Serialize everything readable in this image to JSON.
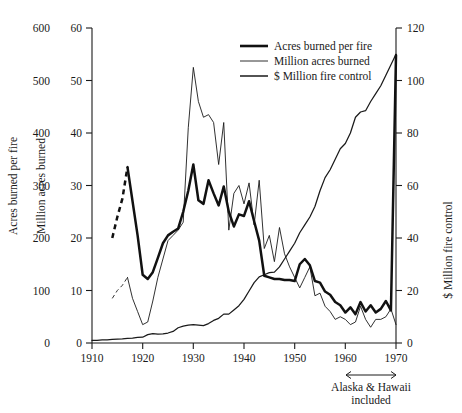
{
  "chart_data": {
    "type": "line",
    "title": "",
    "subtitle": "",
    "xlabel": "",
    "xlim": [
      1910,
      1970
    ],
    "grid": false,
    "legend_position": "top-center-right",
    "x_ticks": [
      1910,
      1920,
      1930,
      1940,
      1950,
      1960,
      1970
    ],
    "x_tick_labels": [
      "1910",
      "1920",
      "1930",
      "1940",
      "1950",
      "1960",
      "1970"
    ],
    "axes": [
      {
        "id": "outer-left",
        "side": "left",
        "label": "Acres burned per fire",
        "ylim": [
          0,
          600
        ],
        "ticks": [
          0,
          100,
          200,
          300,
          400,
          500,
          600
        ],
        "tick_labels": [
          "0",
          "100",
          "200",
          "300",
          "400",
          "500",
          "600"
        ],
        "has_spine": false
      },
      {
        "id": "inner-left",
        "side": "left",
        "label": "Million acres burned",
        "ylim": [
          0,
          60
        ],
        "ticks": [
          0,
          10,
          20,
          30,
          40,
          50,
          60
        ],
        "tick_labels": [
          "0",
          "10",
          "20",
          "30",
          "40",
          "50",
          "60"
        ],
        "has_spine": true
      },
      {
        "id": "right",
        "side": "right",
        "label": "$ Million fire control",
        "ylim": [
          0,
          120
        ],
        "ticks": [
          0,
          20,
          40,
          60,
          80,
          100,
          120
        ],
        "tick_labels": [
          "0",
          "20",
          "40",
          "60",
          "80",
          "100",
          "120"
        ],
        "has_spine": true
      }
    ],
    "annotations": [
      {
        "id": "alaska-hawaii",
        "text_line1": "Alaska & Hawaii",
        "text_line2": "included",
        "x_start": 1960,
        "x_end": 1970,
        "arrow": "double-headed"
      }
    ],
    "legend": [
      {
        "name": "Acres burned per fire",
        "axis": "outer-left",
        "line_weight": "thick"
      },
      {
        "name": "Million acres burned",
        "axis": "inner-left",
        "line_weight": "thin"
      },
      {
        "name": "$ Million fire control",
        "axis": "right",
        "line_weight": "medium"
      }
    ],
    "series": [
      {
        "name": "Acres burned per fire",
        "axis": "outer-left",
        "units": "acres per fire",
        "line_weight": "thick",
        "estimated_segment_years": [
          1914,
          1917
        ],
        "x": [
          1914,
          1915,
          1916,
          1917,
          1918,
          1919,
          1920,
          1921,
          1922,
          1923,
          1924,
          1925,
          1926,
          1927,
          1928,
          1929,
          1930,
          1931,
          1932,
          1933,
          1934,
          1935,
          1936,
          1937,
          1938,
          1939,
          1940,
          1941,
          1942,
          1943,
          1944,
          1945,
          1946,
          1947,
          1948,
          1949,
          1950,
          1951,
          1952,
          1953,
          1954,
          1955,
          1956,
          1957,
          1958,
          1959,
          1960,
          1961,
          1962,
          1963,
          1964,
          1965,
          1966,
          1967,
          1968,
          1969,
          1970
        ],
        "values": [
          200,
          240,
          275,
          335,
          270,
          205,
          130,
          122,
          135,
          162,
          190,
          205,
          212,
          218,
          250,
          290,
          340,
          272,
          265,
          310,
          285,
          262,
          298,
          250,
          222,
          245,
          242,
          270,
          232,
          195,
          128,
          125,
          122,
          122,
          120,
          120,
          118,
          150,
          160,
          148,
          118,
          115,
          98,
          92,
          78,
          72,
          58,
          68,
          55,
          78,
          60,
          72,
          58,
          65,
          80,
          62,
          548
        ]
      },
      {
        "name": "Million acres burned",
        "axis": "inner-left",
        "units": "million acres",
        "line_weight": "thin",
        "estimated_segment_years": [
          1914,
          1917
        ],
        "x": [
          1914,
          1915,
          1916,
          1917,
          1918,
          1919,
          1920,
          1921,
          1922,
          1923,
          1924,
          1925,
          1926,
          1927,
          1928,
          1929,
          1930,
          1931,
          1932,
          1933,
          1934,
          1935,
          1936,
          1937,
          1938,
          1939,
          1940,
          1941,
          1942,
          1943,
          1944,
          1945,
          1946,
          1947,
          1948,
          1949,
          1950,
          1951,
          1952,
          1953,
          1954,
          1955,
          1956,
          1957,
          1958,
          1959,
          1960,
          1961,
          1962,
          1963,
          1964,
          1965,
          1966,
          1967,
          1968,
          1969,
          1970
        ],
        "values": [
          8.5,
          10.0,
          11.0,
          12.5,
          8.5,
          6.0,
          3.5,
          4.0,
          8.0,
          12.5,
          16.0,
          19.5,
          20.5,
          21.5,
          23.0,
          41.0,
          52.5,
          46.0,
          43.0,
          43.5,
          42.0,
          34.0,
          42.0,
          21.5,
          28.5,
          30.0,
          26.5,
          30.5,
          22.5,
          31.0,
          18.0,
          20.5,
          15.5,
          22.0,
          17.0,
          14.5,
          12.5,
          10.5,
          12.5,
          14.5,
          9.0,
          9.5,
          7.0,
          6.0,
          4.5,
          5.0,
          4.5,
          3.5,
          4.0,
          7.0,
          4.5,
          3.0,
          4.5,
          4.5,
          5.0,
          6.5,
          3.5
        ]
      },
      {
        "name": "$ Million fire control",
        "axis": "right",
        "units": "million dollars",
        "line_weight": "medium",
        "x": [
          1910,
          1911,
          1912,
          1913,
          1914,
          1915,
          1916,
          1917,
          1918,
          1919,
          1920,
          1921,
          1922,
          1923,
          1924,
          1925,
          1926,
          1927,
          1928,
          1929,
          1930,
          1931,
          1932,
          1933,
          1934,
          1935,
          1936,
          1937,
          1938,
          1939,
          1940,
          1941,
          1942,
          1943,
          1944,
          1945,
          1946,
          1947,
          1948,
          1949,
          1950,
          1951,
          1952,
          1953,
          1954,
          1955,
          1956,
          1957,
          1958,
          1959,
          1960,
          1961,
          1962,
          1963,
          1964,
          1965,
          1966,
          1967,
          1968,
          1969,
          1970
        ],
        "values": [
          1.0,
          1.0,
          1.2,
          1.2,
          1.4,
          1.5,
          1.6,
          1.8,
          1.9,
          2.1,
          2.2,
          3.2,
          3.6,
          3.4,
          3.5,
          3.8,
          4.4,
          5.8,
          6.4,
          6.8,
          7.0,
          6.8,
          6.6,
          7.4,
          8.6,
          9.4,
          11.0,
          11.0,
          12.6,
          14.2,
          16.6,
          19.8,
          23.0,
          25.2,
          26.0,
          26.8,
          27.0,
          29.0,
          32.0,
          35.0,
          38.0,
          42.0,
          45.0,
          48.0,
          52.0,
          58.0,
          63.0,
          66.0,
          70.0,
          74.0,
          76.0,
          80.0,
          86.0,
          88.0,
          88.5,
          92.0,
          95.0,
          98.0,
          102.0,
          106.0,
          110.0
        ]
      }
    ]
  },
  "legend_labels": {
    "series0": "Acres burned per fire",
    "series1": "Million acres burned",
    "series2": "$ Million fire control"
  },
  "axis_titles": {
    "outer_left": "Acres burned per fire",
    "inner_left": "Million acres burned",
    "right": "$ Million fire control"
  },
  "x_tick_labels": {
    "t0": "1910",
    "t1": "1920",
    "t2": "1930",
    "t3": "1940",
    "t4": "1950",
    "t5": "1960",
    "t6": "1970"
  },
  "outer_left_tick_labels": {
    "t0": "0",
    "t1": "100",
    "t2": "200",
    "t3": "300",
    "t4": "400",
    "t5": "500",
    "t6": "600"
  },
  "inner_left_tick_labels": {
    "t0": "0",
    "t1": "10",
    "t2": "20",
    "t3": "30",
    "t4": "40",
    "t5": "50",
    "t6": "60"
  },
  "right_tick_labels": {
    "t0": "0",
    "t1": "20",
    "t2": "40",
    "t3": "60",
    "t4": "80",
    "t5": "100",
    "t6": "120"
  },
  "annotation": {
    "line1": "Alaska & Hawaii",
    "line2": "included"
  },
  "colors": {
    "background": "#ffffff",
    "ink": "#1a1a1a",
    "thick_line": "#111111"
  }
}
